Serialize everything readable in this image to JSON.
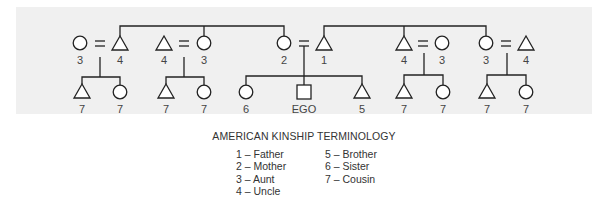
{
  "diagram": {
    "title": "AMERICAN KINSHIP TERMINOLOGY",
    "colors": {
      "background": "#f0f0f0",
      "line": "#222222",
      "text": "#444444"
    },
    "couple_sign": "=",
    "parents_generation": [
      {
        "id": "p1",
        "shape": "circle",
        "label": "3"
      },
      {
        "id": "p2",
        "shape": "triangle",
        "label": "4"
      },
      {
        "id": "p3",
        "shape": "triangle",
        "label": "4"
      },
      {
        "id": "p4",
        "shape": "circle",
        "label": "3"
      },
      {
        "id": "p5",
        "shape": "circle",
        "label": "2"
      },
      {
        "id": "p6",
        "shape": "triangle",
        "label": "1"
      },
      {
        "id": "p7",
        "shape": "triangle",
        "label": "4"
      },
      {
        "id": "p8",
        "shape": "circle",
        "label": "3"
      },
      {
        "id": "p9",
        "shape": "circle",
        "label": "3"
      },
      {
        "id": "p10",
        "shape": "triangle",
        "label": "4"
      }
    ],
    "children_generation": [
      {
        "id": "c1",
        "shape": "triangle",
        "label": "7"
      },
      {
        "id": "c2",
        "shape": "circle",
        "label": "7"
      },
      {
        "id": "c3",
        "shape": "triangle",
        "label": "7"
      },
      {
        "id": "c4",
        "shape": "circle",
        "label": "7"
      },
      {
        "id": "c5",
        "shape": "circle",
        "label": "6"
      },
      {
        "id": "c6",
        "shape": "square",
        "label": "EGO"
      },
      {
        "id": "c7",
        "shape": "triangle",
        "label": "5"
      },
      {
        "id": "c8",
        "shape": "triangle",
        "label": "7"
      },
      {
        "id": "c9",
        "shape": "circle",
        "label": "7"
      },
      {
        "id": "c10",
        "shape": "triangle",
        "label": "7"
      },
      {
        "id": "c11",
        "shape": "circle",
        "label": "7"
      }
    ],
    "legend": {
      "left": [
        "1 – Father",
        "2 – Mother",
        "3 – Aunt",
        "4 – Uncle"
      ],
      "right": [
        "5 – Brother",
        "6 – Sister",
        "7 – Cousin"
      ]
    }
  }
}
